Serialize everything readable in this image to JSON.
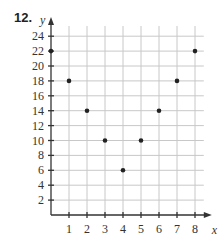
{
  "problem": {
    "number": "12."
  },
  "chart_data": {
    "type": "scatter",
    "title": "",
    "xlabel": "x",
    "ylabel": "y",
    "x": [
      0,
      1,
      2,
      3,
      4,
      5,
      6,
      7,
      8
    ],
    "y": [
      22,
      18,
      14,
      10,
      6,
      10,
      14,
      18,
      22
    ],
    "points": [
      {
        "x": 0,
        "y": 22
      },
      {
        "x": 1,
        "y": 18
      },
      {
        "x": 2,
        "y": 14
      },
      {
        "x": 3,
        "y": 10
      },
      {
        "x": 4,
        "y": 6
      },
      {
        "x": 5,
        "y": 10
      },
      {
        "x": 6,
        "y": 14
      },
      {
        "x": 7,
        "y": 18
      },
      {
        "x": 8,
        "y": 22
      }
    ],
    "xticks": [
      "1",
      "2",
      "3",
      "4",
      "5",
      "6",
      "7",
      "8"
    ],
    "yticks": [
      "2",
      "4",
      "6",
      "8",
      "10",
      "12",
      "14",
      "16",
      "18",
      "20",
      "22",
      "24"
    ],
    "xlim": [
      0,
      8.6
    ],
    "ylim": [
      0,
      25.5
    ],
    "grid": true,
    "legend": null
  }
}
